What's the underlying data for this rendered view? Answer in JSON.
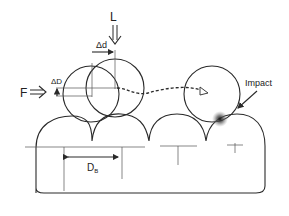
{
  "labels": {
    "load": "L",
    "force": "F",
    "delta_d": "Δd",
    "delta_D": "ΔD",
    "impact": "Impact",
    "diameter_main": "D",
    "diameter_sub": "B"
  },
  "colors": {
    "line": "#2a2a2a",
    "background": "#ffffff"
  }
}
